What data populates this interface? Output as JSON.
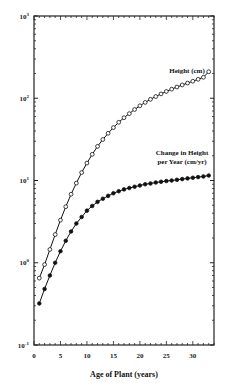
{
  "chart_data": {
    "type": "line",
    "title": "",
    "xlabel": "Age of Plant (years)",
    "ylabel": "",
    "xlim": [
      0,
      34
    ],
    "ylim": [
      0.1,
      1000
    ],
    "yscale": "log",
    "grid": false,
    "x_ticks": [
      0,
      5,
      10,
      15,
      20,
      25,
      30
    ],
    "x_tick_labels": [
      "0",
      "5",
      "10",
      "15",
      "20",
      "25",
      "30"
    ],
    "y_ticks": [
      {
        "base": "10",
        "exp": "3",
        "value": 1000
      },
      {
        "base": "10",
        "exp": "2",
        "value": 100
      },
      {
        "base": "10",
        "exp": "1",
        "value": 10
      },
      {
        "base": "10",
        "exp": "0",
        "value": 1
      },
      {
        "base": "10",
        "exp": "-1",
        "value": 0.1
      }
    ],
    "x": [
      1,
      2,
      3,
      4,
      5,
      6,
      7,
      8,
      9,
      10,
      11,
      12,
      13,
      14,
      15,
      16,
      17,
      18,
      19,
      20,
      21,
      22,
      23,
      24,
      25,
      26,
      27,
      28,
      29,
      30,
      31,
      32,
      33
    ],
    "series": [
      {
        "name": "Height (cm)",
        "marker": "open-circle",
        "label_lines": [
          "Height (cm)"
        ],
        "values": [
          0.65,
          0.95,
          1.45,
          2.2,
          3.3,
          4.8,
          6.8,
          9.3,
          12.5,
          16.3,
          20.8,
          26,
          31.5,
          37.5,
          44,
          51,
          58,
          65,
          73,
          81,
          89,
          97,
          105,
          113,
          121,
          129,
          137,
          145,
          153,
          161,
          170,
          180,
          210
        ]
      },
      {
        "name": "Change in Height per Year (cm/yr)",
        "marker": "filled-circle",
        "label_lines": [
          "Change in Height",
          "per Year (cm/yr)"
        ],
        "values": [
          0.32,
          0.48,
          0.7,
          1.0,
          1.38,
          1.85,
          2.4,
          3.0,
          3.6,
          4.3,
          4.9,
          5.5,
          6.0,
          6.5,
          7.0,
          7.4,
          7.8,
          8.1,
          8.4,
          8.7,
          9.0,
          9.2,
          9.45,
          9.65,
          9.85,
          10.0,
          10.2,
          10.4,
          10.6,
          10.8,
          11.0,
          11.2,
          11.5
        ]
      }
    ]
  }
}
